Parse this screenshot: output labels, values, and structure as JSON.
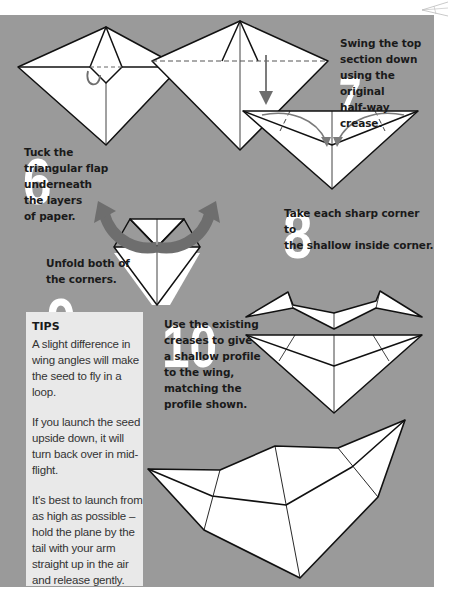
{
  "page": {
    "background": "#ffffff",
    "panel_color": "#9a9a9a",
    "tips_color": "#e9e9e9",
    "arrow_color": "#6e6e6e"
  },
  "steps": [
    {
      "number": "6",
      "text_lines": [
        "Tuck the",
        "triangular flap",
        "underneath",
        "the layers",
        "of paper."
      ]
    },
    {
      "number": "7",
      "text_lines": [
        "Swing the top",
        "section down",
        "using the original",
        "half-way crease."
      ]
    },
    {
      "number": "8",
      "text_lines": [
        "Take each sharp corner to",
        "the shallow inside corner."
      ]
    },
    {
      "number": "9",
      "text_lines": [
        "Unfold both of",
        "the corners."
      ]
    },
    {
      "number": "10",
      "text_lines": [
        "Use the existing",
        "creases to give",
        "a shallow profile",
        "to the wing,",
        "matching the",
        "profile shown."
      ]
    }
  ],
  "tips": {
    "title": "TIPS",
    "paragraphs": [
      "A slight difference in wing angles will make the seed to fly in a loop.",
      "If you launch the seed upside down, it will turn back over in mid-flight.",
      "It's best to launch from as high as possible – hold the plane by the tail with your arm straight up in the air and release gently."
    ]
  },
  "icons": {
    "corner": "paper-plane-outline-icon",
    "tuck_arrow": "curved-tuck-arrow-icon",
    "down_arrow": "down-arrow-icon",
    "fold_arrows": "curved-fold-arrow-icon",
    "unfold_arrows": "unfold-arrow-icon"
  }
}
